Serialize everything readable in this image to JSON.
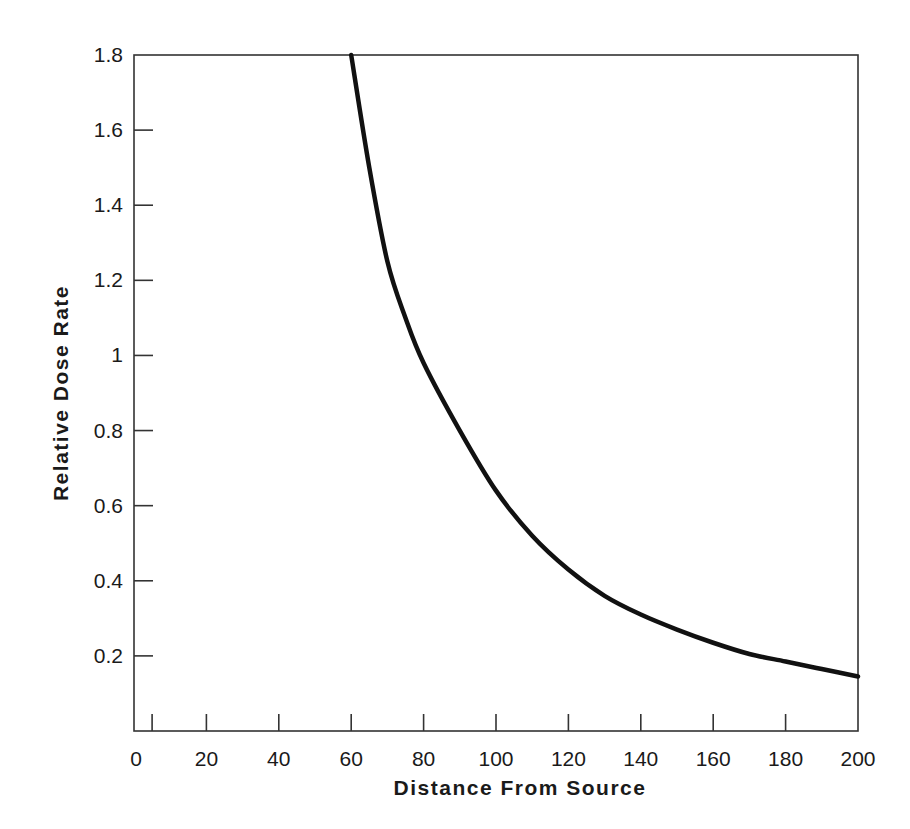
{
  "chart_data": {
    "type": "line",
    "title": "",
    "xlabel": "Distance From Source",
    "ylabel": "Relative Dose Rate",
    "xlim": [
      0,
      200
    ],
    "ylim": [
      0,
      1.8
    ],
    "grid": false,
    "legend": null,
    "x_ticks": [
      5,
      20,
      40,
      60,
      80,
      100,
      120,
      140,
      160,
      180
    ],
    "x_tick_labels": [
      "0",
      "20",
      "40",
      "60",
      "80",
      "100",
      "120",
      "140",
      "160",
      "180",
      "200"
    ],
    "y_ticks": [
      0.2,
      0.4,
      0.6,
      0.8,
      1.0,
      1.2,
      1.4,
      1.6
    ],
    "y_tick_labels": [
      "0.2",
      "0.4",
      "0.6",
      "0.8",
      "1",
      "1.2",
      "1.4",
      "1.6",
      "1.8"
    ],
    "series": [
      {
        "name": "Relative Dose Rate",
        "color": "#111111",
        "x": [
          60,
          65,
          70,
          75,
          80,
          90,
          100,
          110,
          120,
          130,
          140,
          150,
          160,
          170,
          180,
          190,
          200
        ],
        "values": [
          1.8,
          1.5,
          1.25,
          1.1,
          0.98,
          0.8,
          0.64,
          0.52,
          0.43,
          0.36,
          0.31,
          0.27,
          0.235,
          0.205,
          0.185,
          0.165,
          0.145
        ]
      }
    ]
  }
}
